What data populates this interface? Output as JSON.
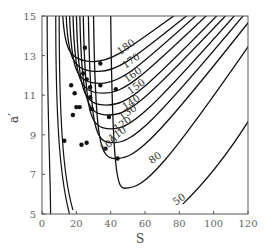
{
  "chart_data": {
    "type": "contour",
    "title": "",
    "xlabel": "S",
    "ylabel": "a′",
    "xlim": [
      0,
      120
    ],
    "ylim": [
      5,
      15
    ],
    "xticks": [
      0,
      20,
      40,
      60,
      80,
      100,
      120
    ],
    "yticks": [
      5,
      7,
      9,
      11,
      13,
      15
    ],
    "grid": false,
    "legend": null,
    "contour_levels": [
      50,
      80,
      100,
      110,
      120,
      130,
      140,
      150,
      160,
      170,
      180
    ],
    "contours": [
      {
        "level": 180,
        "label_pos": [
          50,
          13.3
        ],
        "vertex": [
          30,
          12.7
        ],
        "left_top_s": 12
      },
      {
        "level": 170,
        "label_pos": [
          53,
          12.6
        ],
        "vertex": [
          33,
          12.2
        ],
        "left_top_s": 14
      },
      {
        "level": 160,
        "label_pos": [
          54,
          11.9
        ],
        "vertex": [
          34,
          11.6
        ],
        "left_top_s": 16
      },
      {
        "level": 150,
        "label_pos": [
          56,
          11.3
        ],
        "vertex": [
          36,
          11.1
        ],
        "left_top_s": 18
      },
      {
        "level": 140,
        "label_pos": [
          53,
          10.5
        ],
        "vertex": [
          38,
          10.5
        ],
        "left_top_s": 20
      },
      {
        "level": 130,
        "label_pos": [
          51,
          10.0
        ],
        "vertex": [
          39,
          10.0
        ],
        "left_top_s": 22
      },
      {
        "level": 120,
        "label_pos": [
          48,
          9.4
        ],
        "vertex": [
          40,
          9.3
        ],
        "left_top_s": 24
      },
      {
        "level": 110,
        "label_pos": [
          45,
          8.9
        ],
        "vertex": [
          41,
          8.6
        ],
        "left_top_s": 27
      },
      {
        "level": 100,
        "label_pos": [
          40,
          8.4
        ],
        "vertex": [
          43,
          7.8
        ],
        "left_top_s": 30
      },
      {
        "level": 80,
        "label_pos": [
          67,
          7.7
        ],
        "vertex": [
          48,
          6.3
        ],
        "left_top_s": 40
      },
      {
        "level": 50,
        "label_pos": [
          81,
          5.6
        ],
        "vertex": null,
        "left_top_s": null
      }
    ],
    "scatter_points": [
      {
        "S": 25,
        "a": 13.4
      },
      {
        "S": 34,
        "a": 12.6
      },
      {
        "S": 24,
        "a": 12.1
      },
      {
        "S": 26,
        "a": 11.8
      },
      {
        "S": 17,
        "a": 11.5
      },
      {
        "S": 28,
        "a": 11.4
      },
      {
        "S": 34,
        "a": 11.5
      },
      {
        "S": 19,
        "a": 11.1
      },
      {
        "S": 28,
        "a": 10.9
      },
      {
        "S": 43,
        "a": 11.3
      },
      {
        "S": 20,
        "a": 10.4
      },
      {
        "S": 22,
        "a": 10.4
      },
      {
        "S": 29,
        "a": 10.3
      },
      {
        "S": 18,
        "a": 10.0
      },
      {
        "S": 39,
        "a": 9.9
      },
      {
        "S": 13,
        "a": 8.7
      },
      {
        "S": 23,
        "a": 8.5
      },
      {
        "S": 26,
        "a": 8.6
      },
      {
        "S": 37,
        "a": 8.3
      },
      {
        "S": 44,
        "a": 7.8
      }
    ]
  }
}
